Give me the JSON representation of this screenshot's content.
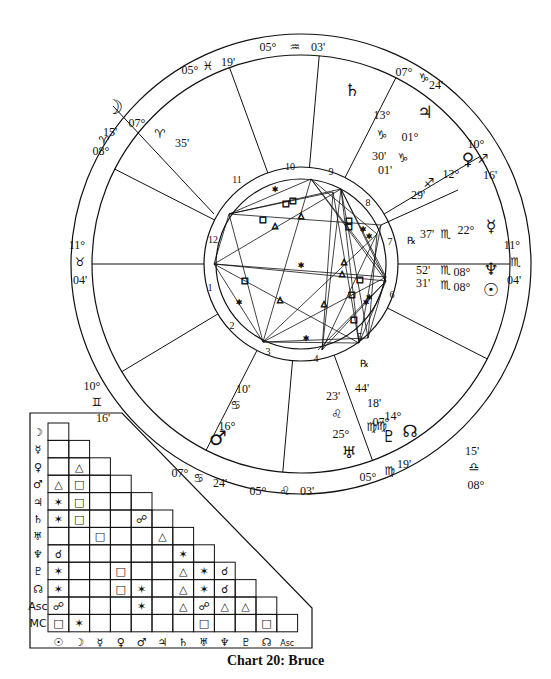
{
  "caption": "Chart 20: Bruce",
  "wheel": {
    "center": [
      301,
      264
    ],
    "outer_radius": 230,
    "zodiac_inner_radius": 209,
    "house_ring_outer": 97,
    "house_ring_inner": 85,
    "house_cusps": [
      {
        "house": 1,
        "label_deg": "11°",
        "sign": "♉",
        "label_min": "04'",
        "pos": "ASC"
      },
      {
        "house": 2,
        "label_deg": "10°",
        "sign": "♊",
        "label_min": "16'"
      },
      {
        "house": 3,
        "label_deg": "07°",
        "sign": "♋",
        "label_min": "24'"
      },
      {
        "house": 4,
        "label_deg": "05°",
        "sign": "♌",
        "label_min": "03'",
        "pos": "IC"
      },
      {
        "house": 5,
        "label_deg": "05°",
        "sign": "♍",
        "label_min": "19'"
      },
      {
        "house": 6,
        "label_deg": "08°",
        "sign": "♎",
        "label_min": "15'"
      },
      {
        "house": 7,
        "label_deg": "11°",
        "sign": "♏",
        "label_min": "04'",
        "pos": "DSC"
      },
      {
        "house": 8,
        "label_deg": "10°",
        "sign": "♐",
        "label_min": "16'"
      },
      {
        "house": 9,
        "label_deg": "07°",
        "sign": "♑",
        "label_min": "24'"
      },
      {
        "house": 10,
        "label_deg": "05°",
        "sign": "♒",
        "label_min": "03'",
        "pos": "MC"
      },
      {
        "house": 11,
        "label_deg": "05°",
        "sign": "♓",
        "label_min": "19'"
      },
      {
        "house": 12,
        "label_deg": "08°",
        "sign": "♈",
        "label_min": "15'"
      }
    ],
    "planets": [
      {
        "name": "Moon",
        "glyph": "☽",
        "deg": "07°",
        "sign": "♈",
        "min": "35'"
      },
      {
        "name": "Saturn",
        "glyph": "♄",
        "deg": "13°",
        "sign": "♑",
        "min": "30'"
      },
      {
        "name": "Jupiter",
        "glyph": "♃",
        "deg": "01°",
        "sign": "♑",
        "min": "01'"
      },
      {
        "name": "Venus",
        "glyph": "♀",
        "deg": "12°",
        "sign": "♐",
        "min": "29'"
      },
      {
        "name": "Mercury",
        "glyph": "☿",
        "deg": "22°",
        "sign": "♏",
        "min": "37'",
        "retrograde": "℞"
      },
      {
        "name": "Neptune",
        "glyph": "♆",
        "deg": "08°",
        "sign": "♏",
        "min": "52'"
      },
      {
        "name": "Sun",
        "glyph": "☉",
        "deg": "08°",
        "sign": "♏",
        "min": "31'"
      },
      {
        "name": "Node",
        "glyph": "☊",
        "deg": "14°",
        "sign": "♍",
        "min": "18'",
        "retrograde": "℞"
      },
      {
        "name": "Pluto",
        "glyph": "♇",
        "deg": "07°",
        "sign": "♍",
        "min": "44'"
      },
      {
        "name": "Uranus",
        "glyph": "♅",
        "deg": "25°",
        "sign": "♌",
        "min": "23'"
      },
      {
        "name": "Mars",
        "glyph": "♂",
        "deg": "16°",
        "sign": "♋",
        "min": "10'"
      }
    ]
  },
  "aspect_grid": {
    "row_labels": [
      "☽",
      "☿",
      "♀",
      "♂",
      "♃",
      "♄",
      "♅",
      "♆",
      "♇",
      "☊",
      "Asc",
      "MC"
    ],
    "col_labels": [
      "☉",
      "☽",
      "☿",
      "♀",
      "♂",
      "♃",
      "♄",
      "♅",
      "♆",
      "♇",
      "☊",
      "Asc"
    ],
    "rows": [
      [
        ""
      ],
      [
        "",
        ""
      ],
      [
        "",
        "△",
        ""
      ],
      [
        "△",
        "□",
        "",
        ""
      ],
      [
        "✶",
        "□",
        "",
        "",
        ""
      ],
      [
        "✶",
        "□",
        "",
        "",
        "☍",
        ""
      ],
      [
        "",
        "",
        "□",
        "",
        "",
        "△",
        ""
      ],
      [
        "☌",
        "",
        "",
        "",
        "",
        "",
        "✶",
        ""
      ],
      [
        "✶",
        "",
        "",
        "□",
        "",
        "",
        "△",
        "✶",
        "☌"
      ],
      [
        "✶",
        "",
        "",
        "□",
        "✶",
        "",
        "△",
        "✶",
        "☌",
        ""
      ],
      [
        "☍",
        "",
        "",
        "",
        "✶",
        "",
        "△",
        "☍",
        "△",
        "△",
        ""
      ],
      [
        "□",
        "✶",
        "",
        "",
        "",
        "",
        "",
        "□",
        "",
        "",
        "□",
        ""
      ]
    ]
  }
}
